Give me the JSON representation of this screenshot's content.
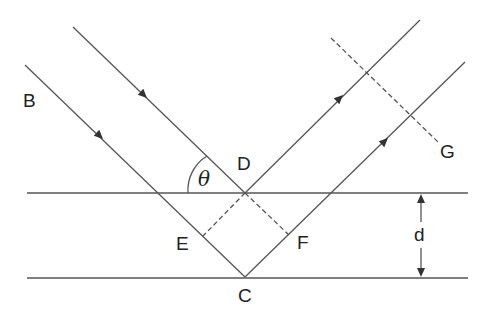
{
  "diagram": {
    "type": "Bragg diffraction geometry",
    "labels": {
      "B": "B",
      "D": "D",
      "E": "E",
      "F": "F",
      "C": "C",
      "G": "G",
      "d": "d",
      "theta": "θ"
    },
    "colors": {
      "line": "#555555",
      "text": "#222222",
      "background": "#ffffff"
    },
    "elements": {
      "planes": [
        "top-plane",
        "bottom-plane"
      ],
      "incident_rays": 2,
      "reflected_rays": 2,
      "dashed_lines": [
        "D-E",
        "D-F",
        "wavefront-G"
      ],
      "spacing_indicator": "d"
    }
  }
}
